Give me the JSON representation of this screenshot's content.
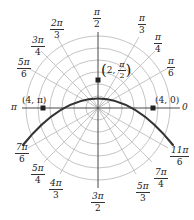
{
  "diagram": {
    "type": "polar-graph",
    "curve_equation": "r = 4 / (1 + sin θ)",
    "colors": {
      "grid": "#b5b5b5",
      "axis": "#333333",
      "curve": "#333333",
      "text": "#222222"
    },
    "angle_labels": [
      {
        "id": "0",
        "num": "0",
        "den": ""
      },
      {
        "id": "pi6",
        "num": "π",
        "den": "6"
      },
      {
        "id": "pi4",
        "num": "π",
        "den": "4"
      },
      {
        "id": "pi3",
        "num": "π",
        "den": "3"
      },
      {
        "id": "pi2",
        "num": "π",
        "den": "2"
      },
      {
        "id": "2pi3",
        "num": "2π",
        "den": "3"
      },
      {
        "id": "3pi4",
        "num": "3π",
        "den": "4"
      },
      {
        "id": "5pi6",
        "num": "5π",
        "den": "6"
      },
      {
        "id": "pi",
        "num": "π",
        "den": ""
      },
      {
        "id": "7pi6",
        "num": "7π",
        "den": "6"
      },
      {
        "id": "5pi4",
        "num": "5π",
        "den": "4"
      },
      {
        "id": "4pi3",
        "num": "4π",
        "den": "3"
      },
      {
        "id": "3pi2",
        "num": "3π",
        "den": "2"
      },
      {
        "id": "5pi3",
        "num": "5π",
        "den": "3"
      },
      {
        "id": "7pi4",
        "num": "7π",
        "den": "4"
      },
      {
        "id": "11pi6",
        "num": "11π",
        "den": "6"
      }
    ],
    "points": [
      {
        "label_r": "2",
        "label_theta_num": "π",
        "label_theta_den": "2",
        "r": 2,
        "theta": "π/2"
      },
      {
        "label": "(4, π)",
        "r": 4,
        "theta": "π"
      },
      {
        "label": "(4, 0)",
        "r": 4,
        "theta": "0"
      }
    ],
    "rings": 6
  }
}
